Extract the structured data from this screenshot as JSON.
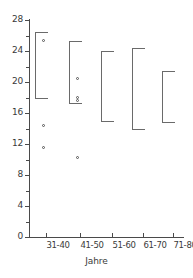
{
  "chart_data": {
    "type": "scatter",
    "title": "",
    "subtitle": "",
    "xlabel": "Jahre",
    "ylabel": "",
    "categories": [
      "31-40",
      "41-50",
      "51-60",
      "61-70",
      "71-80"
    ],
    "ylim": [
      0,
      28
    ],
    "y_ticks": [
      0,
      4,
      8,
      12,
      16,
      20,
      24,
      28
    ],
    "y_tick_labels": [
      "0",
      "4",
      "8",
      "12",
      "16",
      "20",
      "24",
      "28"
    ],
    "y_minor_ticks": [
      2,
      6,
      10,
      14,
      18,
      22,
      26
    ],
    "grid": false,
    "legend": false,
    "legend_position": "none",
    "series": [
      {
        "name": "Bereich",
        "type": "range-bracket",
        "ranges": [
          {
            "category": "31-40",
            "low": 17.8,
            "high": 26.4
          },
          {
            "category": "41-50",
            "low": 17.2,
            "high": 25.3
          },
          {
            "category": "51-60",
            "low": 14.8,
            "high": 24.0
          },
          {
            "category": "61-70",
            "low": 13.8,
            "high": 24.4
          },
          {
            "category": "71-80",
            "low": 14.7,
            "high": 21.4
          }
        ]
      },
      {
        "name": "Messwerte",
        "type": "points",
        "points": [
          {
            "category": "31-40",
            "value": 25.3
          },
          {
            "category": "31-40",
            "value": 14.4
          },
          {
            "category": "31-40",
            "value": 11.6
          },
          {
            "category": "41-50",
            "value": 20.4
          },
          {
            "category": "41-50",
            "value": 18.0
          },
          {
            "category": "41-50",
            "value": 17.6
          },
          {
            "category": "41-50",
            "value": 10.3
          }
        ]
      }
    ]
  },
  "axes": {
    "x_title": "Jahre",
    "y_title": ""
  }
}
